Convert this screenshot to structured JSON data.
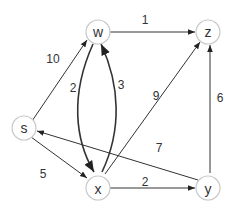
{
  "graph": {
    "nodes": [
      {
        "id": "s",
        "label": "s",
        "x": 24,
        "y": 128
      },
      {
        "id": "w",
        "label": "w",
        "x": 98,
        "y": 32
      },
      {
        "id": "z",
        "label": "z",
        "x": 208,
        "y": 32
      },
      {
        "id": "x",
        "label": "x",
        "x": 98,
        "y": 185
      },
      {
        "id": "y",
        "label": "y",
        "x": 208,
        "y": 185
      }
    ],
    "edges": [
      {
        "from": "s",
        "to": "w",
        "weight": "10"
      },
      {
        "from": "s",
        "to": "x",
        "weight": "5"
      },
      {
        "from": "w",
        "to": "z",
        "weight": "1"
      },
      {
        "from": "w",
        "to": "x",
        "weight": "2"
      },
      {
        "from": "x",
        "to": "w",
        "weight": "3"
      },
      {
        "from": "x",
        "to": "z",
        "weight": "9"
      },
      {
        "from": "x",
        "to": "y",
        "weight": "2"
      },
      {
        "from": "y",
        "to": "s",
        "weight": "7"
      },
      {
        "from": "y",
        "to": "z",
        "weight": "6"
      }
    ]
  }
}
